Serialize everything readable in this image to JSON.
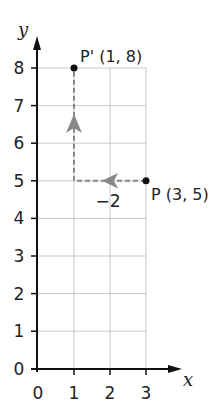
{
  "diagram": {
    "type": "coordinate-grid-translation",
    "axes": {
      "x_label": "x",
      "y_label": "y",
      "x_ticks": [
        "0",
        "1",
        "2",
        "3"
      ],
      "y_ticks": [
        "0",
        "1",
        "2",
        "3",
        "4",
        "5",
        "6",
        "7",
        "8"
      ],
      "x_range": [
        0,
        3
      ],
      "y_range": [
        0,
        8
      ]
    },
    "points": [
      {
        "name": "P",
        "label": "P (3, 5)",
        "x": 3,
        "y": 5
      },
      {
        "name": "P'",
        "label": "P' (1, 8)",
        "x": 1,
        "y": 8
      }
    ],
    "vectors": [
      {
        "from": [
          3,
          5
        ],
        "to": [
          1,
          5
        ],
        "label": "−2",
        "style": "dashed",
        "color": "#888888"
      },
      {
        "from": [
          1,
          5
        ],
        "to": [
          1,
          8
        ],
        "label": "",
        "style": "dashed",
        "color": "#888888"
      }
    ],
    "colors": {
      "axis": "#111111",
      "grid": "#c8c8c8",
      "arrow": "#888888",
      "point": "#111111"
    }
  }
}
